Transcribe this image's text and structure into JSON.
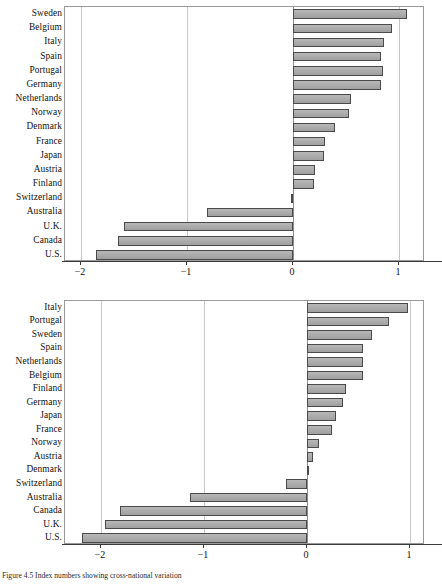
{
  "figure": {
    "caption": "Figure 4.5  Index numbers showing cross-national variation"
  },
  "chart_data": [
    {
      "type": "bar",
      "orientation": "horizontal",
      "title": "",
      "xlabel": "",
      "ylabel": "",
      "xlim": [
        -2.15,
        1.25
      ],
      "xticks": [
        -2,
        -1,
        0,
        1
      ],
      "xticklabels": [
        "−2",
        "−1",
        "0",
        "1"
      ],
      "grid": true,
      "legend": null,
      "categories": [
        "Sweden",
        "Belgium",
        "Italy",
        "Spain",
        "Portugal",
        "Germany",
        "Netherlands",
        "Norway",
        "Denmark",
        "France",
        "Japan",
        "Austria",
        "Finland",
        "Switzerland",
        "Australia",
        "U.K.",
        "Canada",
        "U.S."
      ],
      "values": [
        1.08,
        0.94,
        0.86,
        0.83,
        0.85,
        0.83,
        0.55,
        0.53,
        0.4,
        0.31,
        0.3,
        0.21,
        0.2,
        -0.02,
        -0.81,
        -1.59,
        -1.65,
        -1.86
      ]
    },
    {
      "type": "bar",
      "orientation": "horizontal",
      "title": "",
      "xlabel": "",
      "ylabel": "",
      "xlim": [
        -2.35,
        1.15
      ],
      "xticks": [
        -2,
        -1,
        0,
        1
      ],
      "xticklabels": [
        "−2",
        "−1",
        "0",
        "1"
      ],
      "grid": true,
      "legend": null,
      "categories": [
        "Italy",
        "Portugal",
        "Sweden",
        "Spain",
        "Netherlands",
        "Belgium",
        "Finland",
        "Germany",
        "Japan",
        "France",
        "Norway",
        "Austria",
        "Denmark",
        "Switzerland",
        "Australia",
        "Canada",
        "U.K.",
        "U.S."
      ],
      "values": [
        0.98,
        0.8,
        0.63,
        0.55,
        0.55,
        0.55,
        0.38,
        0.35,
        0.28,
        0.25,
        0.12,
        0.06,
        0.01,
        -0.2,
        -1.13,
        -1.82,
        -1.96,
        -2.18
      ]
    }
  ],
  "colors": {
    "bar_fill": "#a8a8a8",
    "bar_stroke": "#4a4a4a",
    "gridline": "#c9c9c9",
    "axis": "#3a3a3a",
    "plot_border": "#9a9a9a",
    "background": "#ffffff"
  }
}
